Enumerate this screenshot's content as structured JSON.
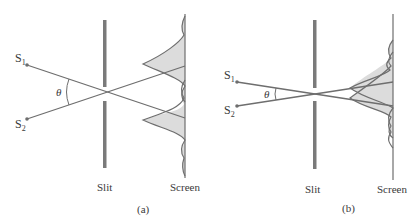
{
  "panels": [
    {
      "id": "a",
      "caption": "(a)",
      "source1": "S",
      "source1_sub": "1",
      "source2": "S",
      "source2_sub": "2",
      "angle": "θ",
      "slit_label": "Slit",
      "screen_label": "Screen"
    },
    {
      "id": "b",
      "caption": "(b)",
      "source1": "S",
      "source1_sub": "1",
      "source2": "S",
      "source2_sub": "2",
      "angle": "θ",
      "slit_label": "Slit",
      "screen_label": "Screen"
    }
  ],
  "colors": {
    "line": "#6e6e6e",
    "slit": "#7a7a7a",
    "fill": "#dcdcdc",
    "text": "#3a3a3a"
  }
}
